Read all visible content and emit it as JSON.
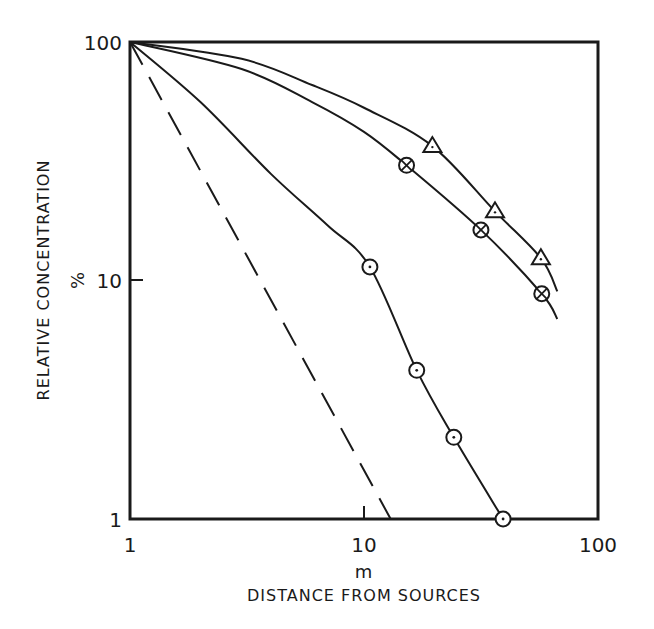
{
  "chart_data": {
    "type": "line",
    "title": "",
    "xlabel": "DISTANCE FROM SOURCES",
    "xunit": "m",
    "ylabel": "RELATIVE CONCENTRATION",
    "yunit": "%",
    "xscale": "log",
    "yscale": "log",
    "xlim": [
      1,
      100
    ],
    "ylim": [
      1,
      100
    ],
    "xticks": [
      "1",
      "10",
      "100"
    ],
    "yticks": [
      "1",
      "10",
      "100"
    ],
    "grid": false,
    "legend": "none",
    "series": [
      {
        "name": "triangle",
        "marker": "triangle",
        "points": [
          [
            19.6,
            36.6
          ],
          [
            36.3,
            19.5
          ],
          [
            57.0,
            12.4
          ]
        ],
        "curve": [
          [
            1,
            100
          ],
          [
            3,
            85
          ],
          [
            6,
            66
          ],
          [
            10,
            53
          ],
          [
            19.6,
            36.6
          ],
          [
            36.3,
            19.5
          ],
          [
            57.0,
            12.4
          ],
          [
            67,
            9.0
          ]
        ]
      },
      {
        "name": "crossed-circle",
        "marker": "circle-cross",
        "points": [
          [
            15.2,
            30.4
          ],
          [
            31.6,
            16.3
          ],
          [
            57.5,
            8.8
          ]
        ],
        "curve": [
          [
            1,
            100
          ],
          [
            3,
            77
          ],
          [
            6,
            56
          ],
          [
            10,
            42
          ],
          [
            15.2,
            30.4
          ],
          [
            31.6,
            16.3
          ],
          [
            57.5,
            8.8
          ],
          [
            67,
            6.9
          ]
        ]
      },
      {
        "name": "dotted-circle",
        "marker": "circle-dot",
        "points": [
          [
            10.6,
            11.4
          ],
          [
            16.8,
            4.2
          ],
          [
            24.2,
            2.2
          ],
          [
            39.3,
            1.0
          ]
        ],
        "curve": [
          [
            1,
            100
          ],
          [
            2,
            56
          ],
          [
            4,
            28
          ],
          [
            7,
            17
          ],
          [
            10.6,
            11.4
          ],
          [
            16.8,
            4.2
          ],
          [
            24.2,
            2.2
          ],
          [
            39.3,
            1.0
          ]
        ]
      },
      {
        "name": "dashed-reference",
        "marker": "none",
        "linestyle": "dashed",
        "points": [],
        "curve": [
          [
            1,
            100
          ],
          [
            13,
            1
          ]
        ]
      }
    ]
  },
  "labels": {
    "y_tick_100": "100",
    "y_tick_10": "10",
    "y_tick_1": "1",
    "x_tick_1": "1",
    "x_tick_10": "10",
    "x_tick_100": "100",
    "x_unit": "m",
    "x_title": "DISTANCE FROM SOURCES",
    "y_title": "RELATIVE CONCENTRATION",
    "y_unit": "%"
  }
}
